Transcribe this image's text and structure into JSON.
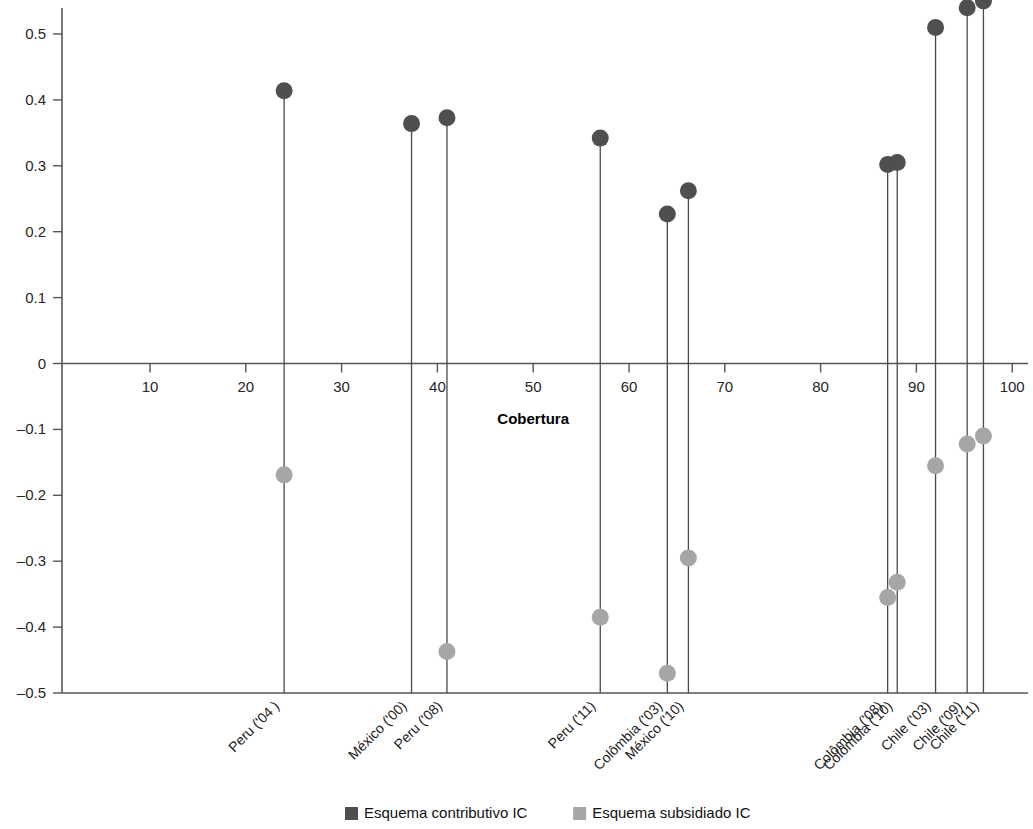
{
  "chart_data": {
    "type": "scatter",
    "title": "",
    "xlabel": "Cobertura",
    "ylabel": "",
    "xlim": [
      0,
      103
    ],
    "ylim": [
      -0.5,
      0.57
    ],
    "xticks": [
      10,
      20,
      30,
      40,
      50,
      60,
      70,
      80,
      90,
      100
    ],
    "yticks": [
      0.5,
      0.4,
      0.3,
      0.2,
      0.1,
      0,
      -0.1,
      -0.2,
      -0.3,
      -0.4,
      -0.5
    ],
    "ytick_labels": [
      "0.5",
      "0.4",
      "0.3",
      "0.2",
      "0.1",
      "0",
      "–0.1",
      "–0.2",
      "–0.3",
      "–0.4",
      "–0.5"
    ],
    "xtick_labels": [
      "10",
      "20",
      "30",
      "40",
      "50",
      "60",
      "70",
      "80",
      "90",
      "100"
    ],
    "grid": false,
    "legend_position": "bottom",
    "series": [
      {
        "name": "Esquema contributivo IC",
        "color": "#4f4f4f",
        "marker": "circle"
      },
      {
        "name": "Esquema subsidiado IC",
        "color": "#a6a6a6",
        "marker": "circle"
      }
    ],
    "points": [
      {
        "label": "Peru ('04 )",
        "x": 24.0,
        "contributivo": 0.414,
        "subsidiado": -0.169
      },
      {
        "label": "México ('00)",
        "x": 37.3,
        "contributivo": 0.364,
        "subsidiado": null
      },
      {
        "label": "Peru ('08)",
        "x": 41.0,
        "contributivo": 0.373,
        "subsidiado": -0.437
      },
      {
        "label": "Peru ('11)",
        "x": 57.0,
        "contributivo": 0.342,
        "subsidiado": -0.385
      },
      {
        "label": "Colômbia ('03)",
        "x": 64.0,
        "contributivo": 0.227,
        "subsidiado": -0.47
      },
      {
        "label": "México ('10)",
        "x": 66.2,
        "contributivo": 0.262,
        "subsidiado": -0.295
      },
      {
        "label": "Colômbia ('08)",
        "x": 87.0,
        "contributivo": 0.302,
        "subsidiado": -0.355
      },
      {
        "label": "Colômbia ('10)",
        "x": 88.0,
        "contributivo": 0.305,
        "subsidiado": -0.332
      },
      {
        "label": "Chile ('03)",
        "x": 92.0,
        "contributivo": 0.51,
        "subsidiado": -0.155
      },
      {
        "label": "Chile ('09)",
        "x": 95.3,
        "contributivo": 0.54,
        "subsidiado": -0.122
      },
      {
        "label": "Chile ('11)",
        "x": 97.0,
        "contributivo": 0.55,
        "subsidiado": -0.11
      }
    ]
  },
  "axis": {
    "x_title": "Cobertura"
  },
  "legend": {
    "items": [
      {
        "label": "Esquema contributivo IC",
        "color": "#4f4f4f"
      },
      {
        "label": "Esquema subsidiado IC",
        "color": "#a6a6a6"
      }
    ]
  }
}
